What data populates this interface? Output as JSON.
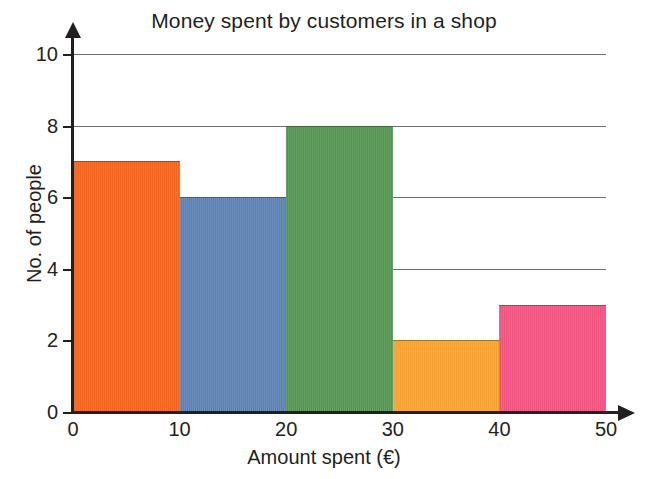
{
  "chart_data": {
    "type": "bar",
    "title": "Money spent by customers in a shop",
    "xlabel": "Amount spent (€)",
    "ylabel": "No. of people",
    "categories": [
      "0–10",
      "10–20",
      "20–30",
      "30–40",
      "40–50"
    ],
    "bin_edges": [
      0,
      10,
      20,
      30,
      40,
      50
    ],
    "values": [
      7,
      6,
      8,
      2,
      3
    ],
    "bar_colors": [
      "#F0641E",
      "#5A80B4",
      "#52954F",
      "#F5A033",
      "#EE5380"
    ],
    "xlim": [
      0,
      50
    ],
    "ylim": [
      0,
      10
    ],
    "xticks": [
      0,
      10,
      20,
      30,
      40,
      50
    ],
    "xtick_labels": [
      "0",
      "10",
      "20",
      "30",
      "40",
      "50"
    ],
    "yticks": [
      0,
      2,
      4,
      6,
      8,
      10
    ],
    "ytick_labels": [
      "0",
      "2",
      "4",
      "6",
      "8",
      "10"
    ],
    "gridlines": [
      2,
      4,
      6,
      8,
      10
    ],
    "grid": true,
    "legend": null,
    "legend_position": "none",
    "axis_color": "#231f20",
    "gridline_color": "#6f6f6f",
    "background": "#ffffff"
  }
}
